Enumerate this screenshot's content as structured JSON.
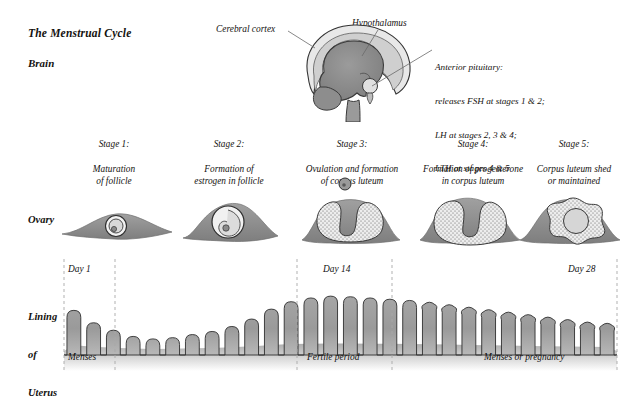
{
  "title": "The Menstrual Cycle",
  "rows": {
    "brain_label": "Brain",
    "ovary_label": "Ovary",
    "uterus_label_line1": "Lining",
    "uterus_label_line2": "of",
    "uterus_label_line3": "Uterus"
  },
  "brain": {
    "callouts": [
      {
        "name": "cerebral-cortex",
        "text": "Cerebral cortex"
      },
      {
        "name": "hypothalamus",
        "text": "Hypothalamus"
      }
    ],
    "anterior_pituitary": {
      "line1": "Anterior pituitary:",
      "line2": "releases FSH at stages 1 & 2;",
      "line3": "LH at stages 2, 3 & 4;",
      "line4": "LTH at stages 4 & 5"
    }
  },
  "stages": [
    {
      "number": "Stage 1:",
      "description": "Maturation\nof follicle",
      "center_x": 114
    },
    {
      "number": "Stage 2:",
      "description": "Formation of\nestrogen in follicle",
      "center_x": 229
    },
    {
      "number": "Stage 3:",
      "description": "Ovulation and formation\nof corpus luteum",
      "center_x": 352
    },
    {
      "number": "Stage 4:",
      "description": "Formation of progesterone\nin corpus luteum",
      "center_x": 473
    },
    {
      "number": "Stage 5:",
      "description": "Corpus luteum shed\nor maintained",
      "center_x": 574
    }
  ],
  "timeline": {
    "days": [
      {
        "label": "Day 1",
        "x": 64
      },
      {
        "label": "Day 14",
        "x": 297
      },
      {
        "label": "Day 28",
        "x": 617
      }
    ],
    "phases": [
      {
        "label": "Menses",
        "x": 64
      },
      {
        "label": "Fertile period",
        "x": 297
      },
      {
        "label": "Menses or pregnancy",
        "x": 484
      }
    ],
    "dashed_lines_x": [
      64,
      115,
      297,
      392,
      617
    ]
  },
  "chart_data": {
    "type": "area",
    "xlabel": "Day of cycle",
    "ylabel": "Endometrial thickness",
    "xlim": [
      1,
      28
    ],
    "ylim": [
      0,
      1
    ],
    "grid": false,
    "legend": false,
    "annotations": [
      "Day 1",
      "Day 14",
      "Day 28",
      "Menses",
      "Fertile period",
      "Menses or pregnancy"
    ],
    "x": [
      1,
      2,
      3,
      4,
      5,
      6,
      7,
      8,
      9,
      10,
      11,
      12,
      13,
      14,
      15,
      16,
      17,
      18,
      19,
      20,
      21,
      22,
      23,
      24,
      25,
      26,
      27,
      28
    ],
    "values": [
      0.72,
      0.52,
      0.4,
      0.3,
      0.26,
      0.28,
      0.33,
      0.38,
      0.46,
      0.58,
      0.74,
      0.86,
      0.92,
      0.95,
      0.94,
      0.92,
      0.9,
      0.88,
      0.84,
      0.8,
      0.76,
      0.72,
      0.68,
      0.64,
      0.6,
      0.56,
      0.52,
      0.5
    ],
    "series_note": "Endometrial lining shown as vertical glandular columns; height falls during menses (days 1-5), rises to peak near day 14, then gradually declines toward day 28."
  },
  "colors": {
    "lining_fill": "#9e9e9e",
    "lining_outline": "#2a2a2a",
    "ovary_body": "#8f8f8f",
    "ovary_light": "#c9c9c9",
    "brain_dark": "#8a8a8a",
    "brain_light": "#e2e2e2",
    "dashed_line": "#a8a8a8",
    "text": "#14120f"
  }
}
